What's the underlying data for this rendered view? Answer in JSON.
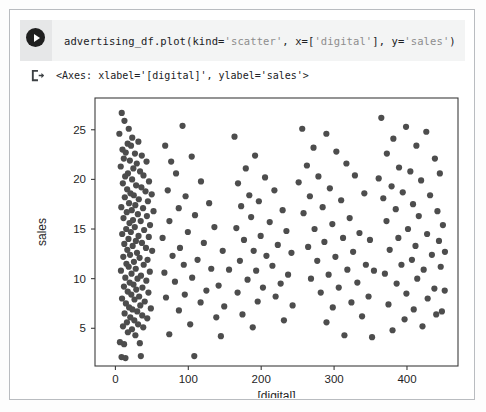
{
  "notebook": {
    "run_button_icon": "play-icon",
    "output_marker_icon": "output-export-icon",
    "code": "advertising_df.plot(kind='scatter', x=['digital'], y='sales')",
    "code_parts": {
      "before_1": "advertising_df.plot(kind=",
      "string_1": "'scatter'",
      "mid_1": ", x=[",
      "string_2": "'digital'",
      "mid_2": "], y=",
      "string_3": "'sales'",
      "after": ")"
    },
    "output_text": "<Axes: xlabel='[digital]', ylabel='sales'>"
  },
  "colors": {
    "marker": "#4d4d4d",
    "axis": "#3c3c3c",
    "cell_background": "#f3f4f4",
    "gutter_background": "#e6e7e8",
    "card_border": "#b9bcc0",
    "text": "#202124"
  },
  "chart_data": {
    "type": "scatter",
    "title": "",
    "xlabel": "[digital]",
    "ylabel": "sales",
    "xlim": [
      -28,
      470
    ],
    "ylim": [
      1.2,
      28.2
    ],
    "xticks": [
      0,
      100,
      200,
      300,
      400
    ],
    "yticks": [
      5,
      10,
      15,
      20,
      25
    ],
    "grid": false,
    "legend": null,
    "marker_size": 5,
    "marker_color": "#4d4d4d",
    "points": [
      [
        8.7,
        26.7
      ],
      [
        12.4,
        25.9
      ],
      [
        18.3,
        25.1
      ],
      [
        5.4,
        24.6
      ],
      [
        23.1,
        24.2
      ],
      [
        16.8,
        23.6
      ],
      [
        21.4,
        23.4
      ],
      [
        31.5,
        23.8
      ],
      [
        9.7,
        23.0
      ],
      [
        14.2,
        22.7
      ],
      [
        26.8,
        22.6
      ],
      [
        36.2,
        22.4
      ],
      [
        11.5,
        22.1
      ],
      [
        19.8,
        21.9
      ],
      [
        29.3,
        21.6
      ],
      [
        42.7,
        21.8
      ],
      [
        7.3,
        21.3
      ],
      [
        24.6,
        21.1
      ],
      [
        33.8,
        20.8
      ],
      [
        17.2,
        20.6
      ],
      [
        13.4,
        20.3
      ],
      [
        38.5,
        20.4
      ],
      [
        22.9,
        20.0
      ],
      [
        46.1,
        19.8
      ],
      [
        10.2,
        19.6
      ],
      [
        28.4,
        19.4
      ],
      [
        35.6,
        19.2
      ],
      [
        16.1,
        19.0
      ],
      [
        41.3,
        18.8
      ],
      [
        20.7,
        18.6
      ],
      [
        25.2,
        18.4
      ],
      [
        49.8,
        18.5
      ],
      [
        12.9,
        18.2
      ],
      [
        32.1,
        18.0
      ],
      [
        44.6,
        17.8
      ],
      [
        18.7,
        17.6
      ],
      [
        27.3,
        17.4
      ],
      [
        8.1,
        17.2
      ],
      [
        37.9,
        17.1
      ],
      [
        22.4,
        16.9
      ],
      [
        15.6,
        16.7
      ],
      [
        52.3,
        16.8
      ],
      [
        30.8,
        16.5
      ],
      [
        43.2,
        16.3
      ],
      [
        11.1,
        16.1
      ],
      [
        24.1,
        15.9
      ],
      [
        34.7,
        15.8
      ],
      [
        19.3,
        15.6
      ],
      [
        47.5,
        15.4
      ],
      [
        26.6,
        15.2
      ],
      [
        14.8,
        15.0
      ],
      [
        39.4,
        14.9
      ],
      [
        21.2,
        14.7
      ],
      [
        9.3,
        14.5
      ],
      [
        31.7,
        14.3
      ],
      [
        45.8,
        14.2
      ],
      [
        17.9,
        14.0
      ],
      [
        28.1,
        13.8
      ],
      [
        36.4,
        13.6
      ],
      [
        12.2,
        13.5
      ],
      [
        23.7,
        13.3
      ],
      [
        41.9,
        13.1
      ],
      [
        16.3,
        12.9
      ],
      [
        50.4,
        12.8
      ],
      [
        29.6,
        12.6
      ],
      [
        20.1,
        12.4
      ],
      [
        10.8,
        12.2
      ],
      [
        33.2,
        12.1
      ],
      [
        44.1,
        11.9
      ],
      [
        25.4,
        11.7
      ],
      [
        15.1,
        11.5
      ],
      [
        38.8,
        11.4
      ],
      [
        18.2,
        11.2
      ],
      [
        27.9,
        11.0
      ],
      [
        7.6,
        10.8
      ],
      [
        47.2,
        10.7
      ],
      [
        22.1,
        10.5
      ],
      [
        35.1,
        10.3
      ],
      [
        13.6,
        10.1
      ],
      [
        30.3,
        10.0
      ],
      [
        42.4,
        9.8
      ],
      [
        19.6,
        9.6
      ],
      [
        24.8,
        9.4
      ],
      [
        11.7,
        9.2
      ],
      [
        37.1,
        9.1
      ],
      [
        28.6,
        8.9
      ],
      [
        16.9,
        8.7
      ],
      [
        45.3,
        8.6
      ],
      [
        21.8,
        8.4
      ],
      [
        32.6,
        8.2
      ],
      [
        9.1,
        8.0
      ],
      [
        26.2,
        7.9
      ],
      [
        40.2,
        7.7
      ],
      [
        14.4,
        7.5
      ],
      [
        34.1,
        7.3
      ],
      [
        18.8,
        7.1
      ],
      [
        23.3,
        6.9
      ],
      [
        48.6,
        7.0
      ],
      [
        29.9,
        6.7
      ],
      [
        12.6,
        6.5
      ],
      [
        36.8,
        6.3
      ],
      [
        20.4,
        6.1
      ],
      [
        43.7,
        6.0
      ],
      [
        25.9,
        5.8
      ],
      [
        15.8,
        5.6
      ],
      [
        31.1,
        5.4
      ],
      [
        10.4,
        5.2
      ],
      [
        38.2,
        5.1
      ],
      [
        22.7,
        4.9
      ],
      [
        17.1,
        4.6
      ],
      [
        27.4,
        4.3
      ],
      [
        6.2,
        3.6
      ],
      [
        11.9,
        3.4
      ],
      [
        33.5,
        3.5
      ],
      [
        8.4,
        2.1
      ],
      [
        13.8,
        2.0
      ],
      [
        34.9,
        2.2
      ],
      [
        68.3,
        23.4
      ],
      [
        92.1,
        25.4
      ],
      [
        76.5,
        21.8
      ],
      [
        104.7,
        22.3
      ],
      [
        83.2,
        20.6
      ],
      [
        117.4,
        19.8
      ],
      [
        71.8,
        18.9
      ],
      [
        96.3,
        18.3
      ],
      [
        128.6,
        17.6
      ],
      [
        86.9,
        17.1
      ],
      [
        109.2,
        16.4
      ],
      [
        74.1,
        15.8
      ],
      [
        135.8,
        15.2
      ],
      [
        99.4,
        14.7
      ],
      [
        64.7,
        14.1
      ],
      [
        121.3,
        13.6
      ],
      [
        88.6,
        13.1
      ],
      [
        147.2,
        12.8
      ],
      [
        78.4,
        12.3
      ],
      [
        112.7,
        11.9
      ],
      [
        93.8,
        11.4
      ],
      [
        131.5,
        11.0
      ],
      [
        67.2,
        10.6
      ],
      [
        155.9,
        10.9
      ],
      [
        105.3,
        10.1
      ],
      [
        81.7,
        9.7
      ],
      [
        141.6,
        9.3
      ],
      [
        124.8,
        8.8
      ],
      [
        95.2,
        8.4
      ],
      [
        69.4,
        8.1
      ],
      [
        116.9,
        7.6
      ],
      [
        149.3,
        7.2
      ],
      [
        87.1,
        6.8
      ],
      [
        138.4,
        6.1
      ],
      [
        102.6,
        5.4
      ],
      [
        73.9,
        4.4
      ],
      [
        144.7,
        4.2
      ],
      [
        108.2,
        2.2
      ],
      [
        163.4,
        24.3
      ],
      [
        178.9,
        21.1
      ],
      [
        191.6,
        22.4
      ],
      [
        168.2,
        19.6
      ],
      [
        205.3,
        20.2
      ],
      [
        183.7,
        18.4
      ],
      [
        218.1,
        18.9
      ],
      [
        172.5,
        17.3
      ],
      [
        196.8,
        17.8
      ],
      [
        229.4,
        16.9
      ],
      [
        186.2,
        16.2
      ],
      [
        211.7,
        15.7
      ],
      [
        165.9,
        15.1
      ],
      [
        234.6,
        14.8
      ],
      [
        199.3,
        14.3
      ],
      [
        176.4,
        13.9
      ],
      [
        222.8,
        13.4
      ],
      [
        189.7,
        12.8
      ],
      [
        207.2,
        12.3
      ],
      [
        241.5,
        12.6
      ],
      [
        170.8,
        11.8
      ],
      [
        215.4,
        11.3
      ],
      [
        193.1,
        10.8
      ],
      [
        236.9,
        10.4
      ],
      [
        181.3,
        9.9
      ],
      [
        226.7,
        9.5
      ],
      [
        202.4,
        9.1
      ],
      [
        167.6,
        8.6
      ],
      [
        219.8,
        8.2
      ],
      [
        195.2,
        7.7
      ],
      [
        243.1,
        7.3
      ],
      [
        174.3,
        6.4
      ],
      [
        231.2,
        5.8
      ],
      [
        188.4,
        5.1
      ],
      [
        256.3,
        25.1
      ],
      [
        271.8,
        23.2
      ],
      [
        289.4,
        24.6
      ],
      [
        262.7,
        21.4
      ],
      [
        303.1,
        22.8
      ],
      [
        278.5,
        20.3
      ],
      [
        316.9,
        21.6
      ],
      [
        251.4,
        19.7
      ],
      [
        294.2,
        19.1
      ],
      [
        328.6,
        20.4
      ],
      [
        266.8,
        18.3
      ],
      [
        309.7,
        17.9
      ],
      [
        284.3,
        17.2
      ],
      [
        341.5,
        18.6
      ],
      [
        258.1,
        16.6
      ],
      [
        321.4,
        16.1
      ],
      [
        297.6,
        15.5
      ],
      [
        273.2,
        15.0
      ],
      [
        334.8,
        14.6
      ],
      [
        312.3,
        14.1
      ],
      [
        286.7,
        13.7
      ],
      [
        349.2,
        13.9
      ],
      [
        264.4,
        13.2
      ],
      [
        326.1,
        12.7
      ],
      [
        301.8,
        12.2
      ],
      [
        276.9,
        11.8
      ],
      [
        343.6,
        11.4
      ],
      [
        318.2,
        10.9
      ],
      [
        292.5,
        10.4
      ],
      [
        354.7,
        10.8
      ],
      [
        268.3,
        10.0
      ],
      [
        331.9,
        9.6
      ],
      [
        306.4,
        9.1
      ],
      [
        281.7,
        8.6
      ],
      [
        347.3,
        8.2
      ],
      [
        323.8,
        7.6
      ],
      [
        298.2,
        7.1
      ],
      [
        338.4,
        6.2
      ],
      [
        289.6,
        5.6
      ],
      [
        314.2,
        4.3
      ],
      [
        352.1,
        4.1
      ],
      [
        364.8,
        26.2
      ],
      [
        381.3,
        24.1
      ],
      [
        398.7,
        25.3
      ],
      [
        372.4,
        22.6
      ],
      [
        412.9,
        23.4
      ],
      [
        389.1,
        21.2
      ],
      [
        426.5,
        24.8
      ],
      [
        361.2,
        20.1
      ],
      [
        404.6,
        20.8
      ],
      [
        438.3,
        22.1
      ],
      [
        378.9,
        19.3
      ],
      [
        419.4,
        19.9
      ],
      [
        394.2,
        18.7
      ],
      [
        445.1,
        20.6
      ],
      [
        367.5,
        18.1
      ],
      [
        431.7,
        18.4
      ],
      [
        408.3,
        17.5
      ],
      [
        384.6,
        17.0
      ],
      [
        441.8,
        16.8
      ],
      [
        416.2,
        16.3
      ],
      [
        371.9,
        15.8
      ],
      [
        449.3,
        15.4
      ],
      [
        401.4,
        15.0
      ],
      [
        427.6,
        14.5
      ],
      [
        388.2,
        14.1
      ],
      [
        443.9,
        13.8
      ],
      [
        411.7,
        13.3
      ],
      [
        376.3,
        12.9
      ],
      [
        434.2,
        12.4
      ],
      [
        406.8,
        11.9
      ],
      [
        452.1,
        12.7
      ],
      [
        392.4,
        11.4
      ],
      [
        422.9,
        10.9
      ],
      [
        369.7,
        10.5
      ],
      [
        446.3,
        11.2
      ],
      [
        414.1,
        10.0
      ],
      [
        385.8,
        9.5
      ],
      [
        437.6,
        9.0
      ],
      [
        399.2,
        8.5
      ],
      [
        428.4,
        8.0
      ],
      [
        374.6,
        7.4
      ],
      [
        451.8,
        8.8
      ],
      [
        409.3,
        6.9
      ],
      [
        440.1,
        6.4
      ],
      [
        396.7,
        5.9
      ],
      [
        421.3,
        5.2
      ],
      [
        380.2,
        4.8
      ],
      [
        447.9,
        6.7
      ]
    ]
  }
}
